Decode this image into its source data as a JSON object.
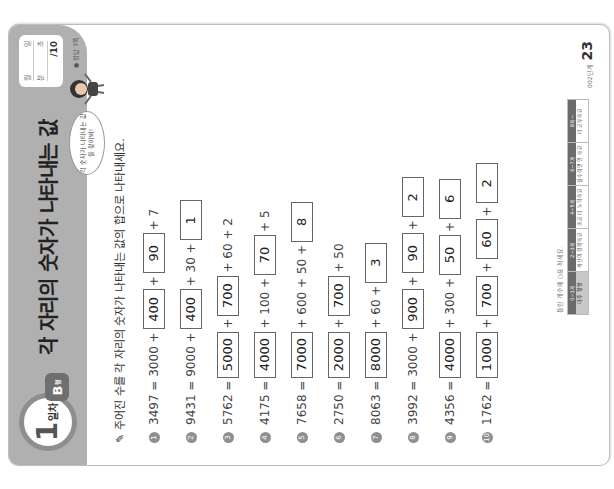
{
  "header": {
    "day_number": "1",
    "day_word": "일차",
    "type_letter": "B",
    "type_suffix": "형",
    "title": "각 자리의 숫자가 나타내는 값",
    "score_box": {
      "row1": [
        "월",
        "일"
      ],
      "row2": [
        "분",
        "초"
      ],
      "row3": "/10"
    },
    "answer_ref": "● 정답 7쪽",
    "speech_bubble": "각 숫자가 나타내는 값을 찾아봐!"
  },
  "instruction": "주어진 수를 각 자리의 숫자가 나타내는 값의 합으로 나타내세요.",
  "problems": [
    {
      "num": "1",
      "tokens": [
        {
          "t": "3497 = 3000 +"
        },
        {
          "a": "400"
        },
        {
          "t": "+"
        },
        {
          "a": "90"
        },
        {
          "t": "+ 7"
        }
      ]
    },
    {
      "num": "2",
      "tokens": [
        {
          "t": "9431 = 9000 +"
        },
        {
          "a": "400"
        },
        {
          "t": "+ 30 +"
        },
        {
          "a": "1"
        }
      ]
    },
    {
      "num": "3",
      "tokens": [
        {
          "t": "5762 ="
        },
        {
          "a": "5000"
        },
        {
          "t": "+"
        },
        {
          "a": "700"
        },
        {
          "t": "+ 60 + 2"
        }
      ]
    },
    {
      "num": "4",
      "tokens": [
        {
          "t": "4175 ="
        },
        {
          "a": "4000"
        },
        {
          "t": "+ 100 +"
        },
        {
          "a": "70"
        },
        {
          "t": "+ 5"
        }
      ]
    },
    {
      "num": "5",
      "tokens": [
        {
          "t": "7658 ="
        },
        {
          "a": "7000"
        },
        {
          "t": "+ 600 + 50 +"
        },
        {
          "a": "8"
        }
      ]
    },
    {
      "num": "6",
      "tokens": [
        {
          "t": "2750 ="
        },
        {
          "a": "2000"
        },
        {
          "t": "+"
        },
        {
          "a": "700"
        },
        {
          "t": "+ 50"
        }
      ]
    },
    {
      "num": "7",
      "tokens": [
        {
          "t": "8063 ="
        },
        {
          "a": "8000"
        },
        {
          "t": "+ 60 +"
        },
        {
          "a": "3"
        }
      ]
    },
    {
      "num": "8",
      "tokens": [
        {
          "t": "3992 = 3000 +"
        },
        {
          "a": "900"
        },
        {
          "t": "+"
        },
        {
          "a": "90"
        },
        {
          "t": "+"
        },
        {
          "a": "2"
        }
      ]
    },
    {
      "num": "9",
      "tokens": [
        {
          "t": "4356 ="
        },
        {
          "a": "4000"
        },
        {
          "t": "+ 300 +"
        },
        {
          "a": "50"
        },
        {
          "t": "+"
        },
        {
          "a": "6"
        }
      ]
    },
    {
      "num": "10",
      "tokens": [
        {
          "t": "1762 ="
        },
        {
          "a": "1000"
        },
        {
          "t": "+"
        },
        {
          "a": "700"
        },
        {
          "t": "+"
        },
        {
          "a": "60"
        },
        {
          "t": "+"
        },
        {
          "a": "2"
        }
      ]
    }
  ],
  "footer": {
    "table_caption": "틀린 개수에 ○표 하세요.",
    "table": [
      {
        "head": "0~1개",
        "body": "아주 잘함"
      },
      {
        "head": "2~3개",
        "body": "계산이 정확해요"
      },
      {
        "head": "4~5개",
        "body": "조금 더 노력해요"
      },
      {
        "head": "6~7개",
        "body": "실수하면 안 돼요"
      },
      {
        "head": "8개~",
        "body": "더 공부해요"
      }
    ],
    "page_code": "002단계",
    "page_number": "23"
  }
}
